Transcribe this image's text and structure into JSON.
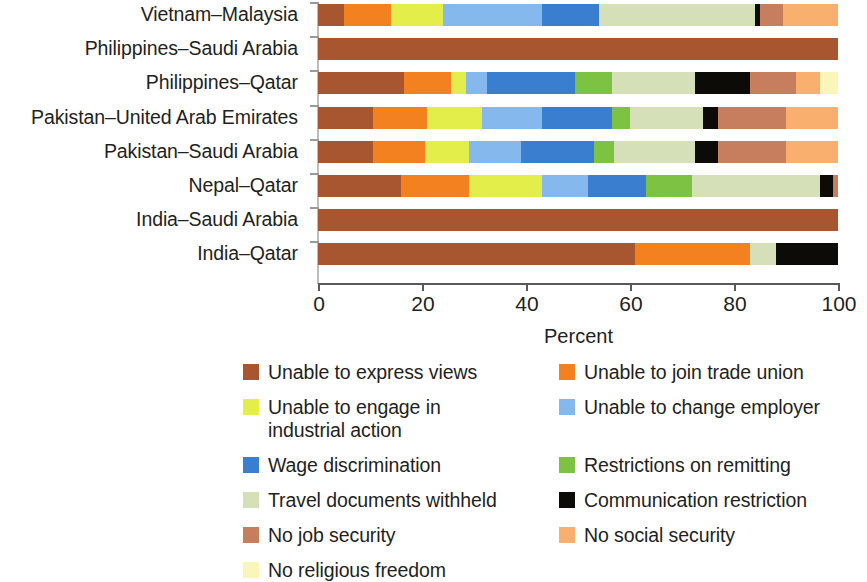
{
  "chart_data": {
    "type": "bar",
    "orientation": "horizontal",
    "stacked": true,
    "stacked_mode": "percent",
    "title": "",
    "xlabel": "Percent",
    "ylabel": "",
    "xlim": [
      0,
      100
    ],
    "xticks": [
      0,
      20,
      40,
      60,
      80,
      100
    ],
    "xtick_labels": [
      "0",
      "20",
      "40",
      "60",
      "80",
      "100"
    ],
    "grid": false,
    "legend_position": "bottom",
    "categories": [
      "Vietnam–Malaysia",
      "Philippines–Saudi Arabia",
      "Philippines–Qatar",
      "Pakistan–United Arab Emirates",
      "Pakistan–Saudi Arabia",
      "Nepal–Qatar",
      "India–Saudi Arabia",
      "India–Qatar"
    ],
    "series": [
      {
        "name": "Unable to express views",
        "color": "#A8562F",
        "values": [
          5.0,
          100.0,
          16.5,
          10.5,
          10.5,
          16.0,
          100.0,
          61.0
        ]
      },
      {
        "name": "Unable to join trade union",
        "color": "#F4811F",
        "values": [
          9.0,
          0.0,
          9.0,
          10.5,
          10.0,
          13.0,
          0.0,
          22.0
        ]
      },
      {
        "name": "Unable to engage in\nindustrial action",
        "color": "#E3EE4A",
        "values": [
          10.0,
          0.0,
          3.0,
          10.5,
          8.5,
          14.0,
          0.0,
          0.0
        ]
      },
      {
        "name": "Unable to change employer",
        "color": "#85B8EC",
        "values": [
          19.0,
          0.0,
          4.0,
          11.5,
          10.0,
          9.0,
          0.0,
          0.0
        ]
      },
      {
        "name": "Wage discrimination",
        "color": "#3A7FCF",
        "values": [
          11.0,
          0.0,
          17.0,
          13.5,
          14.0,
          11.0,
          0.0,
          0.0
        ]
      },
      {
        "name": "Restrictions on remitting",
        "color": "#7DC242",
        "values": [
          0.0,
          0.0,
          7.0,
          3.5,
          4.0,
          9.0,
          0.0,
          0.0
        ]
      },
      {
        "name": "Travel documents withheld",
        "color": "#D5DFB8",
        "values": [
          30.0,
          0.0,
          16.0,
          14.0,
          15.5,
          24.5,
          0.0,
          5.0
        ]
      },
      {
        "name": "Communication restriction",
        "color": "#0D0B08",
        "values": [
          1.0,
          0.0,
          10.5,
          3.0,
          4.5,
          2.5,
          0.0,
          12.0
        ]
      },
      {
        "name": "No job security",
        "color": "#C77E5E",
        "values": [
          4.5,
          0.0,
          9.0,
          13.0,
          13.0,
          1.0,
          0.0,
          0.0
        ]
      },
      {
        "name": "No social security",
        "color": "#F9AF6E",
        "values": [
          10.5,
          0.0,
          4.5,
          10.0,
          10.0,
          0.0,
          0.0,
          0.0
        ]
      },
      {
        "name": "No religious freedom",
        "color": "#FAF6B9",
        "values": [
          0.0,
          0.0,
          3.5,
          0.0,
          0.0,
          0.0,
          0.0,
          0.0
        ]
      }
    ]
  },
  "legend": {
    "entries": [
      {
        "label": "Unable to express views",
        "color": "#A8562F"
      },
      {
        "label": "Unable to join trade union",
        "color": "#F4811F"
      },
      {
        "label": "Unable to engage in\nindustrial action",
        "color": "#E3EE4A"
      },
      {
        "label": "Unable to change employer",
        "color": "#85B8EC"
      },
      {
        "label": "Wage discrimination",
        "color": "#3A7FCF"
      },
      {
        "label": "Restrictions on remitting",
        "color": "#7DC242"
      },
      {
        "label": "Travel documents withheld",
        "color": "#D5DFB8"
      },
      {
        "label": "Communication restriction",
        "color": "#0D0B08"
      },
      {
        "label": "No job security",
        "color": "#C77E5E"
      },
      {
        "label": "No social security",
        "color": "#F9AF6E"
      },
      {
        "label": "No religious freedom",
        "color": "#FAF6B9"
      }
    ]
  },
  "axis": {
    "x_title": "Percent"
  }
}
